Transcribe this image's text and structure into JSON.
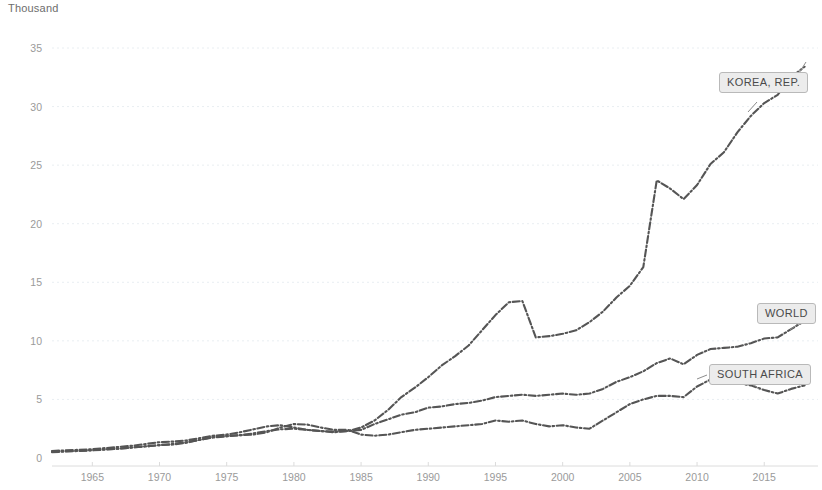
{
  "unit_title": "Thousand",
  "chart_data": {
    "type": "line",
    "title": "Thousand",
    "xlabel": "",
    "ylabel": "Thousand",
    "xlim": [
      1962,
      2019
    ],
    "ylim": [
      0,
      36
    ],
    "grid": true,
    "legend_position": "inline-end-of-line-callouts",
    "yticks": [
      0,
      5,
      10,
      15,
      20,
      25,
      30,
      35
    ],
    "ytick_labels": [
      "0",
      "5",
      "10",
      "15",
      "20",
      "25",
      "30",
      "35"
    ],
    "xticks": [
      1965,
      1970,
      1975,
      1980,
      1985,
      1990,
      1995,
      2000,
      2005,
      2010,
      2015
    ],
    "xtick_labels": [
      "1965",
      "1970",
      "1975",
      "1980",
      "1985",
      "1990",
      "1995",
      "2000",
      "2005",
      "2010",
      "2015"
    ],
    "x": [
      1962,
      1963,
      1964,
      1965,
      1966,
      1967,
      1968,
      1969,
      1970,
      1971,
      1972,
      1973,
      1974,
      1975,
      1976,
      1977,
      1978,
      1979,
      1980,
      1981,
      1982,
      1983,
      1984,
      1985,
      1986,
      1987,
      1988,
      1989,
      1990,
      1991,
      1992,
      1993,
      1994,
      1995,
      1996,
      1997,
      1998,
      1999,
      2000,
      2001,
      2002,
      2003,
      2004,
      2005,
      2006,
      2007,
      2008,
      2009,
      2010,
      2011,
      2012,
      2013,
      2014,
      2015,
      2016,
      2017,
      2018
    ],
    "series": [
      {
        "name": "KOREA, REP.",
        "linestyle": "dashdot",
        "color": "#555555",
        "values": [
          0.6,
          0.65,
          0.7,
          0.75,
          0.85,
          0.95,
          1.05,
          1.2,
          1.35,
          1.4,
          1.5,
          1.7,
          1.9,
          2.0,
          2.2,
          2.45,
          2.7,
          2.8,
          2.6,
          2.4,
          2.3,
          2.2,
          2.3,
          2.6,
          3.2,
          4.1,
          5.2,
          6.0,
          6.9,
          7.9,
          8.7,
          9.6,
          10.9,
          12.2,
          13.3,
          13.4,
          10.3,
          10.4,
          10.6,
          10.9,
          11.6,
          12.5,
          13.7,
          14.7,
          16.3,
          23.7,
          23.0,
          22.1,
          23.3,
          25.1,
          26.1,
          27.8,
          29.2,
          30.3,
          31.0,
          32.5,
          33.4
        ]
      },
      {
        "name": "WORLD",
        "linestyle": "dashdot",
        "color": "#555555",
        "values": [
          0.55,
          0.58,
          0.62,
          0.68,
          0.75,
          0.8,
          0.9,
          1.0,
          1.1,
          1.2,
          1.35,
          1.55,
          1.75,
          1.85,
          1.95,
          2.1,
          2.3,
          2.45,
          2.5,
          2.4,
          2.3,
          2.25,
          2.3,
          2.4,
          2.9,
          3.3,
          3.7,
          3.9,
          4.3,
          4.4,
          4.6,
          4.7,
          4.9,
          5.2,
          5.3,
          5.4,
          5.3,
          5.4,
          5.5,
          5.4,
          5.5,
          5.9,
          6.5,
          6.9,
          7.4,
          8.1,
          8.5,
          8.0,
          8.8,
          9.3,
          9.4,
          9.5,
          9.8,
          10.2,
          10.3,
          11.0,
          11.7
        ]
      },
      {
        "name": "SOUTH AFRICA",
        "linestyle": "dashdot",
        "color": "#555555",
        "values": [
          0.5,
          0.55,
          0.6,
          0.65,
          0.72,
          0.8,
          0.9,
          1.0,
          1.1,
          1.15,
          1.3,
          1.55,
          1.8,
          1.9,
          1.95,
          2.0,
          2.2,
          2.6,
          2.9,
          2.85,
          2.6,
          2.4,
          2.4,
          2.0,
          1.9,
          2.0,
          2.2,
          2.4,
          2.5,
          2.6,
          2.7,
          2.8,
          2.9,
          3.2,
          3.1,
          3.2,
          2.9,
          2.7,
          2.8,
          2.6,
          2.5,
          3.2,
          3.9,
          4.6,
          5.0,
          5.3,
          5.3,
          5.2,
          6.1,
          6.7,
          6.6,
          6.4,
          6.2,
          5.8,
          5.5,
          5.9,
          6.2
        ]
      }
    ]
  },
  "series_labels": {
    "korea": "KOREA, REP.",
    "world": "WORLD",
    "south_africa": "SOUTH AFRICA"
  }
}
